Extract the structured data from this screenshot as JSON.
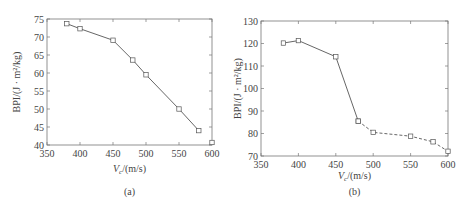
{
  "chart_data": [
    {
      "type": "line",
      "panel_label": "(a)",
      "xlabel": "V_c/(m/s)",
      "ylabel": "BPI/(J · m²/kg)",
      "xlim": [
        350,
        600
      ],
      "ylim": [
        40,
        75
      ],
      "xticks": [
        350,
        400,
        450,
        500,
        550,
        600
      ],
      "yticks": [
        40,
        45,
        50,
        55,
        60,
        65,
        70,
        75
      ],
      "grid": false,
      "series": [
        {
          "name": "BPI",
          "style": "solid",
          "marker": "square",
          "x": [
            380,
            400,
            450,
            480,
            500,
            550,
            580
          ],
          "y": [
            73.7,
            72.3,
            69.1,
            63.6,
            59.5,
            50.0,
            44.0
          ]
        },
        {
          "name": "isolated point",
          "style": "none",
          "marker": "square",
          "x": [
            600
          ],
          "y": [
            40.7
          ]
        }
      ]
    },
    {
      "type": "line",
      "panel_label": "(b)",
      "xlabel": "V_c/(m/s)",
      "ylabel": "BPI/(J · m²/kg)",
      "xlim": [
        350,
        600
      ],
      "ylim": [
        70,
        130
      ],
      "xticks": [
        350,
        400,
        450,
        500,
        550,
        600
      ],
      "yticks": [
        70,
        80,
        90,
        100,
        110,
        120,
        130
      ],
      "grid": false,
      "series": [
        {
          "name": "solid segment",
          "style": "solid",
          "marker": "square",
          "x": [
            380,
            400,
            450,
            480
          ],
          "y": [
            120.2,
            121.3,
            114.1,
            85.5
          ]
        },
        {
          "name": "dashed segment",
          "style": "dashed",
          "marker": "square",
          "x": [
            480,
            500,
            550,
            580,
            600
          ],
          "y": [
            85.5,
            80.5,
            78.8,
            76.3,
            72.1
          ]
        }
      ]
    }
  ],
  "labels": {
    "a": {
      "ylabel": "BPI/(J · m²/kg)",
      "xlabel_v": "V",
      "xlabel_sub": "c",
      "xlabel_rest": "/(m/s)",
      "panel": "(a)"
    },
    "b": {
      "ylabel": "BPI/(J · m²/kg)",
      "xlabel_v": "V",
      "xlabel_sub": "c",
      "xlabel_rest": "/(m/s)",
      "panel": "(b)"
    }
  }
}
